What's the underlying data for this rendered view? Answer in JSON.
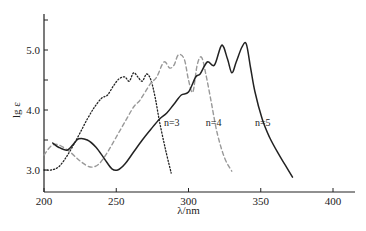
{
  "chart_data": {
    "type": "line",
    "title": "",
    "xlabel": "λ/nm",
    "ylabel": "lg ε",
    "xlim": [
      200,
      415
    ],
    "ylim": [
      2.7,
      5.6
    ],
    "xticks": [
      200,
      250,
      300,
      350,
      400
    ],
    "xtick_labels": [
      "200",
      "250",
      "300",
      "350",
      "400"
    ],
    "yticks": [
      3.0,
      4.0,
      5.0
    ],
    "ytick_labels": [
      "3.0",
      "4.0",
      "5.0"
    ],
    "y_minor_ticks": [
      3.5,
      4.5,
      5.5
    ],
    "grid": false,
    "legend": "none (inline annotations)",
    "series": [
      {
        "name": "n=3",
        "style": "dotted",
        "x": [
          200,
          205,
          210,
          215,
          220,
          225,
          230,
          235,
          240,
          244,
          248,
          252,
          256,
          259,
          262,
          265,
          268,
          271,
          274,
          277,
          280,
          284,
          288
        ],
        "y": [
          3.0,
          3.0,
          3.05,
          3.2,
          3.4,
          3.62,
          3.85,
          4.05,
          4.2,
          4.25,
          4.4,
          4.52,
          4.55,
          4.48,
          4.62,
          4.55,
          4.48,
          4.6,
          4.5,
          4.2,
          3.8,
          3.35,
          2.95
        ]
      },
      {
        "name": "n=4",
        "style": "dashed",
        "x": [
          200,
          205,
          210,
          218,
          225,
          232,
          238,
          244,
          250,
          256,
          262,
          266,
          270,
          274,
          278,
          283,
          287,
          290,
          293,
          297,
          300,
          303,
          306,
          309,
          312,
          316,
          320,
          325,
          330
        ],
        "y": [
          3.25,
          3.4,
          3.42,
          3.3,
          3.15,
          3.05,
          3.1,
          3.3,
          3.55,
          3.8,
          4.05,
          4.15,
          4.3,
          4.45,
          4.55,
          4.8,
          4.7,
          4.75,
          4.92,
          4.85,
          4.5,
          4.3,
          4.75,
          4.88,
          4.6,
          4.1,
          3.6,
          3.2,
          2.98
        ]
      },
      {
        "name": "n=5",
        "style": "solid",
        "x": [
          206,
          210,
          216,
          220,
          224,
          230,
          236,
          242,
          247,
          251,
          256,
          262,
          268,
          274,
          280,
          285,
          290,
          295,
          300,
          305,
          308,
          313,
          318,
          323,
          327,
          330,
          333,
          337,
          340,
          343,
          346,
          351,
          356,
          362,
          367,
          372
        ],
        "y": [
          3.45,
          3.38,
          3.33,
          3.42,
          3.52,
          3.5,
          3.38,
          3.18,
          3.02,
          3.0,
          3.1,
          3.3,
          3.5,
          3.68,
          3.85,
          3.95,
          4.1,
          4.25,
          4.3,
          4.55,
          4.6,
          4.8,
          4.75,
          5.08,
          4.85,
          4.62,
          4.8,
          5.05,
          5.1,
          4.7,
          4.3,
          3.85,
          3.55,
          3.28,
          3.08,
          2.88
        ]
      }
    ],
    "annotations": [
      {
        "text": "n=3",
        "x": 283,
        "y": 3.8
      },
      {
        "text": "n=4",
        "x": 312,
        "y": 3.8
      },
      {
        "text": "n=5",
        "x": 346,
        "y": 3.8
      }
    ]
  }
}
